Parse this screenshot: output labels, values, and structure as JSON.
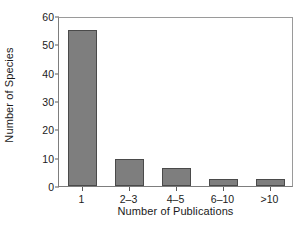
{
  "chart_data": {
    "type": "bar",
    "title": "",
    "xlabel": "Number of Publications",
    "ylabel": "Number of Species",
    "categories": [
      "1",
      "2–3",
      "4–5",
      "6–10",
      ">10"
    ],
    "values": [
      55,
      9.5,
      6.5,
      2.5,
      2.5
    ],
    "ylim": [
      0,
      60
    ],
    "yticks": [
      0,
      10,
      20,
      30,
      40,
      50,
      60
    ],
    "ytick_labels": [
      "0",
      "10",
      "20",
      "30",
      "40",
      "50",
      "60"
    ],
    "grid": false,
    "legend": null,
    "series": [
      {
        "name": "Number of Species",
        "values": [
          55,
          9.5,
          6.5,
          2.5,
          2.5
        ]
      }
    ],
    "colors": {
      "bar_fill": "#7e7e7e",
      "bar_edge": "#4a4a4a",
      "axis": "#7d7d7d",
      "text": "#1a1a1a",
      "background": "#ffffff"
    }
  }
}
